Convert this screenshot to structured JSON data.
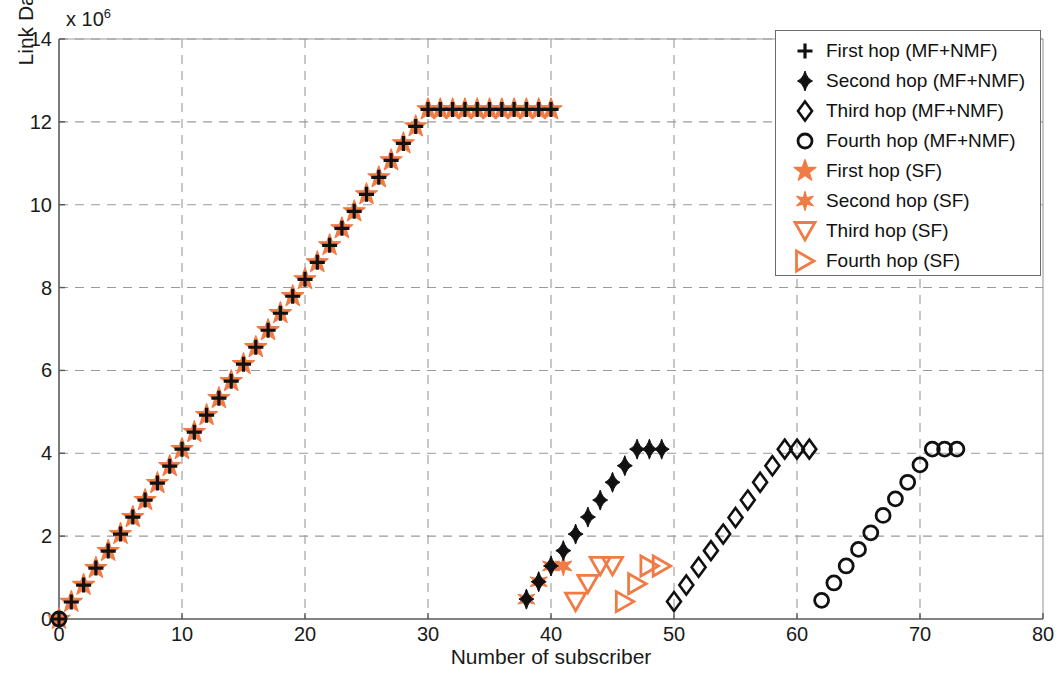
{
  "chart_data": {
    "type": "scatter",
    "title": "",
    "xlabel": "Number of subscriber",
    "ylabel": "Link Data Rate in bps",
    "y_multiplier": "x 10",
    "y_multiplier_exp": "6",
    "xlim": [
      0,
      80
    ],
    "ylim": [
      0,
      14000000
    ],
    "xticks": [
      0,
      10,
      20,
      30,
      40,
      50,
      60,
      70,
      80
    ],
    "yticks": [
      0,
      2,
      4,
      6,
      8,
      10,
      12,
      14
    ],
    "ytick_labels": [
      "0",
      "2",
      "4",
      "6",
      "8",
      "10",
      "12",
      "14"
    ],
    "xtick_labels": [
      "0",
      "10",
      "20",
      "30",
      "40",
      "50",
      "60",
      "70",
      "80"
    ],
    "grid": true,
    "grid_style": "dashed",
    "legend_position": "top-right",
    "colors": {
      "mf_nmf": "#111111",
      "sf": "#F07B45",
      "grid": "#9a9a9a",
      "axis": "#6b6b6b"
    },
    "series": [
      {
        "name": "First hop (MF+NMF)",
        "marker": "plus",
        "color": "#111111",
        "x": [
          0,
          1,
          2,
          3,
          4,
          5,
          6,
          7,
          8,
          9,
          10,
          11,
          12,
          13,
          14,
          15,
          16,
          17,
          18,
          19,
          20,
          21,
          22,
          23,
          24,
          25,
          26,
          27,
          28,
          29,
          30,
          31,
          32,
          33,
          34,
          35,
          36,
          37,
          38,
          39,
          40
        ],
        "y": [
          0,
          0.41,
          0.82,
          1.23,
          1.64,
          2.05,
          2.46,
          2.87,
          3.28,
          3.69,
          4.1,
          4.51,
          4.92,
          5.33,
          5.74,
          6.15,
          6.56,
          6.97,
          7.38,
          7.79,
          8.2,
          8.61,
          9.02,
          9.43,
          9.84,
          10.25,
          10.66,
          11.07,
          11.48,
          11.89,
          12.3,
          12.3,
          12.3,
          12.3,
          12.3,
          12.3,
          12.3,
          12.3,
          12.3,
          12.3,
          12.3
        ]
      },
      {
        "name": "Second hop (MF+NMF)",
        "marker": "diamond-filled",
        "color": "#111111",
        "x": [
          38,
          39,
          40,
          41,
          42,
          43,
          44,
          45,
          46,
          47,
          48,
          49
        ],
        "y": [
          0.48,
          0.9,
          1.28,
          1.65,
          2.05,
          2.46,
          2.87,
          3.3,
          3.7,
          4.1,
          4.1,
          4.1
        ]
      },
      {
        "name": "Third hop (MF+NMF)",
        "marker": "diamond-open",
        "color": "#111111",
        "x": [
          50,
          51,
          52,
          53,
          54,
          55,
          56,
          57,
          58,
          59,
          60,
          61
        ],
        "y": [
          0.42,
          0.82,
          1.25,
          1.65,
          2.05,
          2.45,
          2.87,
          3.3,
          3.7,
          4.1,
          4.1,
          4.1
        ]
      },
      {
        "name": "Fourth hop (MF+NMF)",
        "marker": "circle-open",
        "color": "#111111",
        "x": [
          0,
          62,
          63,
          64,
          65,
          66,
          67,
          68,
          69,
          70,
          71,
          72,
          73
        ],
        "y": [
          0,
          0.45,
          0.87,
          1.28,
          1.68,
          2.08,
          2.5,
          2.9,
          3.3,
          3.72,
          4.1,
          4.1,
          4.1
        ]
      },
      {
        "name": "First hop (SF)",
        "marker": "star5",
        "color": "#F07B45",
        "x": [
          0,
          1,
          2,
          3,
          4,
          5,
          6,
          7,
          8,
          9,
          10,
          11,
          12,
          13,
          14,
          15,
          16,
          17,
          18,
          19,
          20,
          21,
          22,
          23,
          24,
          25,
          26,
          27,
          28,
          29,
          30,
          31,
          32,
          33,
          34,
          35,
          36,
          37,
          38,
          39,
          40
        ],
        "y": [
          0,
          0.41,
          0.82,
          1.23,
          1.64,
          2.05,
          2.46,
          2.87,
          3.28,
          3.69,
          4.1,
          4.51,
          4.92,
          5.33,
          5.74,
          6.15,
          6.56,
          6.97,
          7.38,
          7.79,
          8.2,
          8.61,
          9.02,
          9.43,
          9.84,
          10.25,
          10.66,
          11.07,
          11.48,
          11.89,
          12.3,
          12.3,
          12.3,
          12.3,
          12.3,
          12.3,
          12.3,
          12.3,
          12.3,
          12.3,
          12.3
        ]
      },
      {
        "name": "Second hop (SF)",
        "marker": "star6",
        "color": "#F07B45",
        "x": [
          38,
          39,
          40,
          41
        ],
        "y": [
          0.48,
          0.9,
          1.28,
          1.28
        ]
      },
      {
        "name": "Third hop (SF)",
        "marker": "triangle-down",
        "color": "#F07B45",
        "x": [
          42,
          43,
          44,
          45
        ],
        "y": [
          0.42,
          0.85,
          1.28,
          1.28
        ]
      },
      {
        "name": "Fourth hop (SF)",
        "marker": "triangle-right",
        "color": "#F07B45",
        "x": [
          46,
          47,
          48,
          49
        ],
        "y": [
          0.42,
          0.85,
          1.28,
          1.28
        ]
      }
    ],
    "legend_entries": [
      {
        "label": "First hop (MF+NMF)",
        "marker": "plus",
        "color": "#111111"
      },
      {
        "label": "Second hop (MF+NMF)",
        "marker": "diamond-filled",
        "color": "#111111"
      },
      {
        "label": "Third hop (MF+NMF)",
        "marker": "diamond-open",
        "color": "#111111"
      },
      {
        "label": "Fourth hop (MF+NMF)",
        "marker": "circle-open",
        "color": "#111111"
      },
      {
        "label": "First hop (SF)",
        "marker": "star5",
        "color": "#F07B45"
      },
      {
        "label": "Second hop (SF)",
        "marker": "star6",
        "color": "#F07B45"
      },
      {
        "label": "Third hop (SF)",
        "marker": "triangle-down",
        "color": "#F07B45"
      },
      {
        "label": "Fourth hop (SF)",
        "marker": "triangle-right",
        "color": "#F07B45"
      }
    ]
  }
}
